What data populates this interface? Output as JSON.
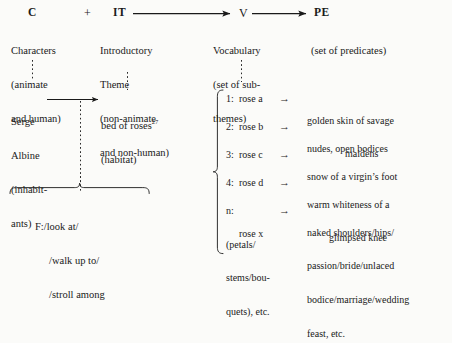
{
  "diagram": {
    "header_row": {
      "c_label": "C",
      "plus": "+",
      "it_label": "IT",
      "v_label": "V",
      "pe_label": "PE"
    },
    "columns": [
      {
        "key": "characters",
        "code": "C",
        "gloss_lines": [
          "Characters",
          "(animate",
          "and human)"
        ]
      },
      {
        "key": "introductory-theme",
        "code": "IT",
        "gloss_lines": [
          "Introductory",
          "Theme",
          "(non-animate",
          "and non-human)"
        ]
      },
      {
        "key": "vocabulary",
        "code": "V",
        "gloss_lines": [
          "Vocabulary",
          "(set of sub-",
          "themes)"
        ]
      },
      {
        "key": "predicates",
        "code": "PE",
        "gloss_lines": [
          "(set of predicates)"
        ]
      }
    ],
    "instance_row": {
      "characters": [
        "Serge",
        "Albine",
        "(inhabit-",
        "ants)"
      ],
      "theme": "bed of roses",
      "theme_footnote": "27",
      "theme_gloss": "(habitat)"
    },
    "function_box": {
      "label": "F:/look at/",
      "lines": [
        "F:/look at/",
        "/walk up to/",
        "/stroll among"
      ]
    },
    "vocabulary_list": [
      {
        "index": "1:",
        "term": "rose a",
        "arrow": "→",
        "predicate_lines": [
          "golden skin of savage",
          "maidens"
        ],
        "predicate_indent": [
          0,
          1
        ]
      },
      {
        "index": "2:",
        "term": "rose b",
        "arrow": "→",
        "predicate_lines": [
          "nudes, open bodices"
        ],
        "predicate_indent": [
          0
        ]
      },
      {
        "index": "3:",
        "term": "rose c",
        "arrow": "→",
        "predicate_lines": [
          "snow of a virgin’s foot"
        ],
        "predicate_indent": [
          0
        ]
      },
      {
        "index": "4:",
        "term": "rose d",
        "arrow": "→",
        "predicate_lines": [
          "warm whiteness of a",
          "glimpsed knee"
        ],
        "predicate_indent": [
          0,
          1
        ]
      },
      {
        "index": "n:",
        "term": "rose x",
        "arrow": "→",
        "term_extra_lines": [
          "(petals/",
          "stems/bou-",
          "quets), etc."
        ],
        "predicate_lines": [
          "naked shoulders/hips/",
          "passion/bride/unlaced",
          "bodice/marriage/wedding",
          "feast, etc."
        ],
        "predicate_indent": [
          0,
          0,
          0,
          0
        ]
      }
    ],
    "connectors": {
      "it_to_v_arrow": "→",
      "v_to_pe_arrow": "→",
      "serge_to_theme_arrow": "→"
    },
    "colors": {
      "ink": "#1a1a1a",
      "paper": "#fbfbf9"
    }
  }
}
